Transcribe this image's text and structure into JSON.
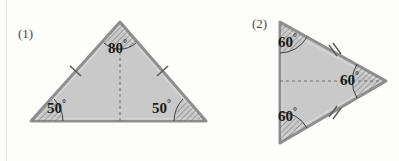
{
  "page": {
    "background_color": "#fdfdfb",
    "width": 399,
    "height": 161
  },
  "figures": [
    {
      "id": "figure-1",
      "label": "(1)",
      "shape": "triangle",
      "description": "isosceles triangle with apex up and dashed altitude",
      "fill_color": "#c9c9c9",
      "stroke_color": "#8a8a8a",
      "vertices": {
        "apex": [
          120,
          22
        ],
        "bottom_left": [
          31,
          121
        ],
        "bottom_right": [
          206,
          121
        ]
      },
      "angles": [
        {
          "name": "apex-angle",
          "value": "80",
          "degree_symbol": "°",
          "at": "apex"
        },
        {
          "name": "base-left-angle",
          "value": "50",
          "degree_symbol": "°",
          "at": "bottom_left"
        },
        {
          "name": "base-right-angle",
          "value": "50",
          "degree_symbol": "°",
          "at": "bottom_right"
        }
      ],
      "tick_marks": [
        {
          "side": "left-side",
          "count": 1
        },
        {
          "side": "right-side",
          "count": 1
        }
      ],
      "dashed_line": "altitude from apex to base midpoint"
    },
    {
      "id": "figure-2",
      "label": "(2)",
      "shape": "triangle",
      "description": "equilateral triangle pointing right with dashed median",
      "fill_color": "#c9c9c9",
      "stroke_color": "#8a8a8a",
      "vertices": {
        "top_left": [
          280,
          22
        ],
        "bottom_left": [
          280,
          143
        ],
        "right": [
          386,
          81
        ]
      },
      "angles": [
        {
          "name": "top-angle",
          "value": "60",
          "degree_symbol": "°",
          "at": "top_left"
        },
        {
          "name": "right-angle",
          "value": "60",
          "degree_symbol": "°",
          "at": "right"
        },
        {
          "name": "bottom-angle",
          "value": "60",
          "degree_symbol": "°",
          "at": "bottom_left"
        }
      ],
      "tick_marks": [
        {
          "side": "upper-right-side",
          "count": 2
        },
        {
          "side": "lower-right-side",
          "count": 2
        }
      ],
      "dashed_line": "median from left side midpoint to right vertex"
    }
  ],
  "colors": {
    "triangle_fill": "#c9c9c9",
    "triangle_stroke": "#8a8a8a",
    "angle_text": "#1b1b1b",
    "figure_label": "#4a4a4a",
    "dashed_line": "#6e6e6e",
    "page_edge": "#e2e2e0"
  }
}
